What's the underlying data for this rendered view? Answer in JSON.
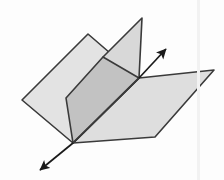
{
  "figure": {
    "width": 224,
    "height": 180,
    "background_color": "#fdfdfd",
    "stroke_color": "#3a3a3a",
    "stroke_width": 1.6,
    "arrow_color": "#1a1a1a"
  },
  "colors": {
    "plane_left_fill": "#e3e3e3",
    "plane_right_fill": "#dedede",
    "plane_upper_wing_fill": "#d8d8d8",
    "overlap_fill": "#c2c2c2",
    "outline": "#3a3a3a",
    "arrow": "#1a1a1a",
    "seam": "#f2f2f2"
  },
  "geometry": {
    "intersection_line": {
      "name": "line-of-intersection",
      "point_upper": [
        139,
        78
      ],
      "point_lower": [
        73,
        143
      ],
      "arrow_tip_upper": [
        168,
        47
      ],
      "arrow_tip_lower": [
        38,
        172
      ]
    },
    "plane_left": {
      "name": "plane-one",
      "label": "Plane 1",
      "points": "88,34 22,100 73,143 139,78"
    },
    "plane_right_lower": {
      "name": "plane-two-lower-wing",
      "label": "Plane 2 lower wing",
      "points": "139,78 214,70 155,137 73,143"
    },
    "plane_right_upper": {
      "name": "plane-two-upper-wing",
      "label": "Plane 2 upper wing",
      "points": "142,18 139,78 73,143 103,57"
    },
    "overlap_region": {
      "name": "overlap-quad",
      "label": "Intersection overlap",
      "points": "103,57 139,78 73,143 66,98"
    }
  },
  "arrows": {
    "upper": {
      "name": "arrow-up-right",
      "direction": "up-right",
      "from": [
        139,
        78
      ],
      "to": [
        168,
        47
      ],
      "head_size": 9
    },
    "lower": {
      "name": "arrow-down-left",
      "direction": "down-left",
      "from": [
        73,
        143
      ],
      "to": [
        38,
        172
      ],
      "head_size": 9
    }
  },
  "seam": {
    "name": "scan-seam-artifact",
    "x": 197,
    "visible": true
  }
}
